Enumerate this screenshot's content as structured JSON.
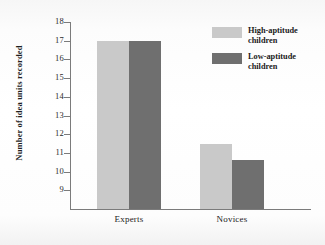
{
  "chart_data": {
    "type": "bar",
    "title": "",
    "xlabel": "",
    "ylabel": "Number of idea units recorded",
    "categories": [
      "Experts",
      "Novices"
    ],
    "series": [
      {
        "name": "High-aptitude children",
        "values": [
          17.0,
          11.5
        ],
        "color": "#c9c9c9"
      },
      {
        "name": "Low-aptitude children",
        "values": [
          17.0,
          10.6
        ],
        "color": "#6f6f6f"
      }
    ],
    "ylim": [
      8,
      18
    ],
    "yticks": [
      9,
      10,
      11,
      12,
      13,
      14,
      15,
      16,
      17,
      18
    ],
    "ytick_labels": [
      "9",
      "10",
      "11",
      "12",
      "13",
      "14",
      "15",
      "16",
      "17",
      "18"
    ],
    "grid": false,
    "legend_position": "top-right"
  },
  "axis": {
    "y_title": "Number of idea units recorded",
    "ticks": [
      {
        "label": "18",
        "value": 18
      },
      {
        "label": "17",
        "value": 17
      },
      {
        "label": "16",
        "value": 16
      },
      {
        "label": "15",
        "value": 15
      },
      {
        "label": "14",
        "value": 14
      },
      {
        "label": "13",
        "value": 13
      },
      {
        "label": "12",
        "value": 12
      },
      {
        "label": "11",
        "value": 11
      },
      {
        "label": "10",
        "value": 10
      },
      {
        "label": "9",
        "value": 9
      }
    ]
  },
  "groups": [
    {
      "label": "Experts",
      "light": 17.0,
      "dark": 17.0
    },
    {
      "label": "Novices",
      "light": 11.5,
      "dark": 10.6
    }
  ],
  "legend": {
    "items": [
      {
        "label": "High-aptitude children",
        "color": "#c9c9c9"
      },
      {
        "label": "Low-aptitude children",
        "color": "#6f6f6f"
      }
    ]
  },
  "colors": {
    "light_bar": "#c9c9c9",
    "dark_bar": "#6f6f6f",
    "axis": "#7b7b7b",
    "text": "#1b1b1b",
    "background": "#fbfbfb"
  }
}
